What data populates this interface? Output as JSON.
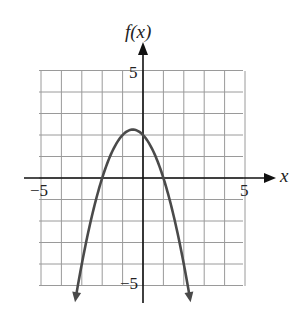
{
  "chart_data": {
    "type": "line",
    "title": "",
    "xlabel": "x",
    "ylabel": "f(x)",
    "xlim": [
      -5,
      5
    ],
    "ylim": [
      -5,
      5
    ],
    "grid": true,
    "x_tick_labels": [
      "-5",
      "5"
    ],
    "y_tick_labels": [
      "5",
      "-5"
    ],
    "series": [
      {
        "name": "f(x)",
        "description": "downward-opening parabola, f(x) = -(x+2)(x-1), vertex (-0.5, 2.25), x-intercepts -2 and 1, arrows at both ends",
        "x": [
          -3.5,
          -3,
          -2.5,
          -2,
          -1.5,
          -1,
          -0.5,
          0,
          0.5,
          1,
          1.5,
          2,
          2.5
        ],
        "y": [
          -6.75,
          -4,
          -1.75,
          0,
          1.25,
          2,
          2.25,
          2,
          1.25,
          0,
          -1.75,
          -4,
          -6.75
        ]
      }
    ],
    "colors": {
      "curve": "#4a4a4a",
      "grid": "#9a9a9a",
      "axis": "#111111"
    }
  },
  "labels": {
    "y_axis": "f(x)",
    "x_axis": "x",
    "x_min": "−5",
    "x_max": "5",
    "y_max": "5",
    "y_min": "−5"
  }
}
